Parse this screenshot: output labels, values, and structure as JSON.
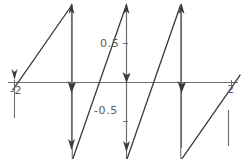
{
  "figure": {
    "kind": "sawtooth-wave-plot",
    "background_color": "#ffffff",
    "curve_color": "#3a3a3a",
    "axis_color": "#6e6e6e",
    "label_color": "#5a5a5a"
  },
  "axes": {
    "x_axis_label": "",
    "y_axis_label": "",
    "x_ticks": [
      {
        "value": -2,
        "label": "-2"
      },
      {
        "value": 2,
        "label": "2"
      }
    ],
    "y_ticks": [
      {
        "value": 0.5,
        "label": "0.5"
      },
      {
        "value": -0.5,
        "label": "-0.5"
      }
    ]
  },
  "chart_data": {
    "type": "line",
    "title": "",
    "subtitle": "",
    "xlabel": "",
    "ylabel": "",
    "grid": false,
    "legend": null,
    "xlim": [
      -2.1,
      2.1
    ],
    "ylim": [
      -1.05,
      1.05
    ],
    "xticks": [
      -2,
      2
    ],
    "xticklabels": [
      "-2",
      "2"
    ],
    "yticks": [
      0.5,
      -0.5
    ],
    "yticklabels": [
      "0.5",
      "-0.5"
    ],
    "period": 2,
    "amplitude": 1,
    "discontinuities_x": [
      -1,
      0,
      1
    ],
    "series": [
      {
        "name": "sawtooth",
        "x": [
          -2.1,
          -1.0,
          -1.0,
          0.0,
          0.0,
          1.0,
          1.0,
          2.1
        ],
        "y": [
          -0.1,
          1.0,
          -1.0,
          1.0,
          -1.0,
          1.0,
          -1.0,
          0.1
        ]
      }
    ],
    "segments": [
      {
        "from": [
          -2.1,
          -0.1
        ],
        "to": [
          -1.0,
          1.0
        ]
      },
      {
        "from": [
          -1.0,
          1.0
        ],
        "to": [
          -1.0,
          -1.0
        ]
      },
      {
        "from": [
          -1.0,
          -1.0
        ],
        "to": [
          0.0,
          1.0
        ]
      },
      {
        "from": [
          0.0,
          1.0
        ],
        "to": [
          0.0,
          -1.0
        ]
      },
      {
        "from": [
          0.0,
          -1.0
        ],
        "to": [
          1.0,
          1.0
        ]
      },
      {
        "from": [
          1.0,
          1.0
        ],
        "to": [
          1.0,
          -1.0
        ]
      },
      {
        "from": [
          1.0,
          -1.0
        ],
        "to": [
          2.1,
          0.1
        ]
      }
    ]
  }
}
